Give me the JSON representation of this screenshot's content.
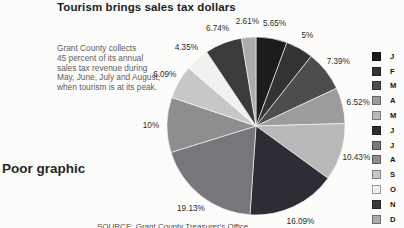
{
  "page": {
    "background": "#fcfcfb"
  },
  "title": "Tourism brings sales tax dollars",
  "annotation": {
    "lines": [
      "Grant County collects",
      "45 percent of its annual",
      "sales tax revenue during",
      "May, June, July and August,",
      "when tourism is at its peak."
    ]
  },
  "caption": "Poor graphic",
  "source": "SOURCE: Grant County Treasurer's Office",
  "chart_data": {
    "type": "pie",
    "title": "Tourism brings sales tax dollars",
    "start_angle_deg": 0,
    "direction": "clockwise",
    "legend_position": "right",
    "legend_labels": [
      "J",
      "F",
      "M",
      "A",
      "M",
      "J",
      "J",
      "A",
      "S",
      "O",
      "N",
      "D"
    ],
    "slices": [
      {
        "label": "J",
        "value": 5.65,
        "display": "5.65%",
        "color": "#1c1c1c"
      },
      {
        "label": "F",
        "value": 5.0,
        "display": "5%",
        "color": "#333333"
      },
      {
        "label": "M",
        "value": 7.39,
        "display": "7.39%",
        "color": "#4d4d4d"
      },
      {
        "label": "A",
        "value": 6.52,
        "display": "6.52%",
        "color": "#9c9c9c"
      },
      {
        "label": "M",
        "value": 10.43,
        "display": "10.43%",
        "color": "#b9b9b9"
      },
      {
        "label": "J",
        "value": 16.09,
        "display": "16.09%",
        "color": "#2d2d35"
      },
      {
        "label": "J",
        "value": 19.13,
        "display": "19.13%",
        "color": "#76767b"
      },
      {
        "label": "A",
        "value": 10.0,
        "display": "10%",
        "color": "#8e8e8e"
      },
      {
        "label": "S",
        "value": 6.09,
        "display": "6.09%",
        "color": "#c7c7c7"
      },
      {
        "label": "O",
        "value": 4.35,
        "display": "4.35%",
        "color": "#f0f0ee"
      },
      {
        "label": "N",
        "value": 6.74,
        "display": "6.74%",
        "color": "#3b3b3b"
      },
      {
        "label": "D",
        "value": 2.61,
        "display": "2.61%",
        "color": "#ababab"
      }
    ]
  }
}
